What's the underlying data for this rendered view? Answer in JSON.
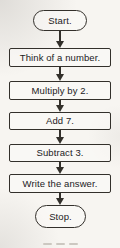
{
  "flow": {
    "nodes": [
      {
        "id": "start",
        "type": "terminator",
        "label": "Start."
      },
      {
        "id": "think",
        "type": "process",
        "label": "Think of a number."
      },
      {
        "id": "multiply",
        "type": "process",
        "label": "Multiply by 2."
      },
      {
        "id": "add",
        "type": "process",
        "label": "Add 7."
      },
      {
        "id": "subtract",
        "type": "process",
        "label": "Subtract 3."
      },
      {
        "id": "write",
        "type": "process",
        "label": "Write the answer."
      },
      {
        "id": "stop",
        "type": "terminator",
        "label": "Stop."
      }
    ],
    "edges": [
      {
        "from": "start",
        "to": "think"
      },
      {
        "from": "think",
        "to": "multiply"
      },
      {
        "from": "multiply",
        "to": "add"
      },
      {
        "from": "add",
        "to": "subtract"
      },
      {
        "from": "subtract",
        "to": "write"
      },
      {
        "from": "write",
        "to": "stop"
      }
    ],
    "colors": {
      "line": "#33302b",
      "text": "#23211d",
      "paper": "#f7f5f1"
    }
  }
}
